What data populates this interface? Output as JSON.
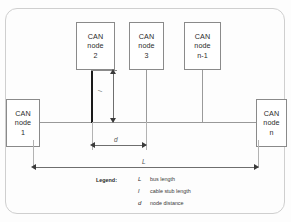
{
  "diagram": {
    "nodes": [
      {
        "id": "node2",
        "line1": "CAN",
        "line2": "node",
        "line3": "2",
        "position": "top"
      },
      {
        "id": "node3",
        "line1": "CAN",
        "line2": "node",
        "line3": "3",
        "position": "top"
      },
      {
        "id": "nodeN1",
        "line1": "CAN",
        "line2": "node",
        "line3": "n-1",
        "position": "top"
      },
      {
        "id": "node1",
        "line1": "CAN",
        "line2": "node",
        "line3": "1",
        "position": "left"
      },
      {
        "id": "nodeN",
        "line1": "CAN",
        "line2": "node",
        "line3": "n",
        "position": "right"
      }
    ],
    "dimensions": {
      "bus_length_label": "L",
      "stub_length_label": "l",
      "node_distance_label": "d"
    },
    "legend": {
      "title": "Legend:",
      "entries": [
        {
          "symbol": "L",
          "text": "bus length"
        },
        {
          "symbol": "l",
          "text": "cable stub length"
        },
        {
          "symbol": "d",
          "text": "node distance"
        }
      ]
    },
    "colors": {
      "frame": "#cfcfcf",
      "bus_line": "#999999",
      "stub_line": "#9a9a9a",
      "emphasized_stub": "#1a1a1a",
      "dimension_line": "#6e6e6e",
      "box_border": "#8a8a8a",
      "text": "#2b2b2b"
    }
  }
}
